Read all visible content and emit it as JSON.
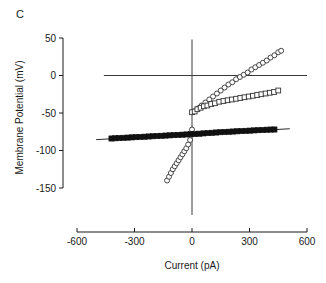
{
  "panel": {
    "label": "C"
  },
  "chart_data": {
    "type": "scatter",
    "title": "",
    "xlabel": "Current (pA)",
    "ylabel": "Membrane Potential (mV)",
    "xlim": [
      -600,
      600
    ],
    "ylim": [
      -150,
      50
    ],
    "xticks": [
      -600,
      -300,
      0,
      300,
      600
    ],
    "yticks": [
      50,
      0,
      -50,
      -100,
      -150
    ],
    "xtick_labels": [
      "-600",
      "-300",
      "0",
      "300",
      "600"
    ],
    "ytick_labels": [
      "50",
      "0",
      "-50",
      "-100",
      "-150"
    ],
    "grid": false,
    "legend": "none",
    "zero_lines": {
      "horizontal_at_y": 0,
      "vertical_at_x": 0
    },
    "series": [
      {
        "name": "open-circles",
        "marker": "open-circle",
        "color": "#333333",
        "x": [
          -130,
          -120,
          -110,
          -100,
          -90,
          -80,
          -70,
          -60,
          -50,
          -40,
          -30,
          -20,
          -10,
          0,
          10,
          30,
          50,
          70,
          90,
          110,
          130,
          150,
          170,
          190,
          210,
          230,
          250,
          270,
          290,
          310,
          330,
          350,
          370,
          390,
          410,
          430,
          450,
          465
        ],
        "y": [
          -140,
          -135,
          -130,
          -125,
          -121,
          -117,
          -113,
          -109,
          -105,
          -101,
          -97,
          -92,
          -86,
          -72,
          -48,
          -44,
          -40,
          -36,
          -32,
          -28,
          -24,
          -20,
          -16,
          -12,
          -9,
          -5,
          -2,
          1,
          4,
          8,
          11,
          14,
          17,
          20,
          24,
          27,
          31,
          33
        ]
      },
      {
        "name": "open-squares",
        "marker": "open-square",
        "color": "#333333",
        "x": [
          0,
          14,
          28,
          45,
          62,
          80,
          100,
          120,
          142,
          164,
          186,
          208,
          230,
          252,
          274,
          296,
          318,
          340,
          362,
          384,
          406,
          428,
          450
        ],
        "y": [
          -49,
          -48,
          -45,
          -43,
          -41,
          -40,
          -38,
          -37,
          -35,
          -34,
          -33,
          -32,
          -31,
          -30,
          -29,
          -28,
          -27,
          -26,
          -25,
          -24,
          -23,
          -22,
          -20
        ]
      },
      {
        "name": "filled-squares",
        "marker": "filled-square",
        "color": "#111111",
        "x": [
          -420,
          -400,
          -380,
          -358,
          -336,
          -314,
          -292,
          -270,
          -248,
          -226,
          -204,
          -182,
          -160,
          -138,
          -116,
          -94,
          -72,
          -50,
          -28,
          -6,
          16,
          38,
          60,
          82,
          104,
          126,
          148,
          170,
          192,
          214,
          236,
          258,
          280,
          302,
          324,
          346,
          368,
          390,
          412,
          430
        ],
        "y": [
          -84,
          -83.7,
          -83.4,
          -83.1,
          -82.8,
          -82.5,
          -82.2,
          -81.9,
          -81.6,
          -81.3,
          -81.0,
          -80.7,
          -80.4,
          -80.1,
          -79.8,
          -79.5,
          -79.2,
          -78.9,
          -78.6,
          -78.3,
          -78.0,
          -77.6,
          -77.2,
          -76.8,
          -76.4,
          -76.0,
          -75.6,
          -75.3,
          -75.0,
          -74.7,
          -74.4,
          -74.1,
          -73.8,
          -73.5,
          -73.2,
          -72.9,
          -72.6,
          -72.3,
          -72.1,
          -72.0
        ]
      }
    ],
    "fit_lines": [
      {
        "name": "filled-square-fit",
        "x1": -500,
        "y1": -85.5,
        "x2": 510,
        "y2": -71.0
      }
    ]
  }
}
